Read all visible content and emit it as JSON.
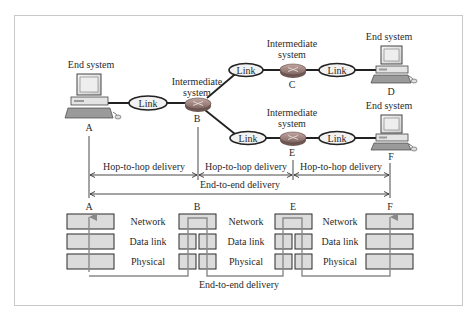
{
  "figure": {
    "nodes": {
      "A": {
        "label": "A",
        "role": "End system",
        "caption": "End system"
      },
      "B": {
        "label": "B",
        "role": "Intermediate system",
        "caption_line1": "Intermediate",
        "caption_line2": "system"
      },
      "C": {
        "label": "C",
        "role": "Intermediate system",
        "caption_line1": "Intermediate",
        "caption_line2": "system"
      },
      "D": {
        "label": "D",
        "role": "End system",
        "caption": "End system"
      },
      "E": {
        "label": "E",
        "role": "Intermediate system",
        "caption_line1": "Intermediate",
        "caption_line2": "system"
      },
      "F": {
        "label": "F",
        "role": "End system",
        "caption": "End system"
      }
    },
    "links": [
      {
        "id": "A-B",
        "label": "Link"
      },
      {
        "id": "B-C",
        "label": "Link"
      },
      {
        "id": "C-D",
        "label": "Link"
      },
      {
        "id": "B-E",
        "label": "Link"
      },
      {
        "id": "E-F",
        "label": "Link"
      }
    ],
    "delivery": {
      "hop1": "Hop-to-hop delivery",
      "hop2": "Hop-to-hop delivery",
      "hop3": "Hop-to-hop delivery",
      "end_to_end": "End-to-end delivery"
    },
    "stack": {
      "columns": [
        "A",
        "B",
        "E",
        "F"
      ],
      "layers": [
        "Network",
        "Data link",
        "Physical"
      ],
      "bottom_label": "End-to-end delivery"
    }
  }
}
